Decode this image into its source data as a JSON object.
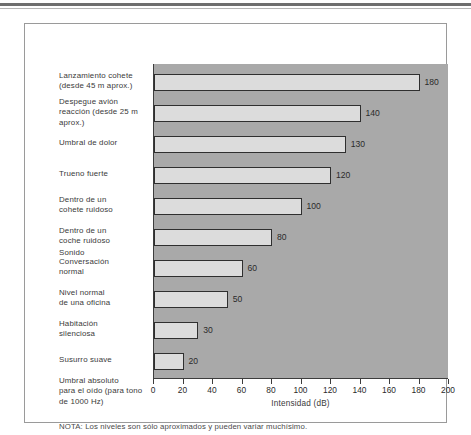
{
  "figure": {
    "note": "NOTA: Los niveles son sólo aproximados y pueden variar muchísimo.",
    "sound_marker": "Sonido"
  },
  "chart_data": {
    "type": "bar",
    "orientation": "horizontal",
    "title": "",
    "xlabel": "Intensidad (dB)",
    "ylabel": "",
    "xlim": [
      0,
      200
    ],
    "grid": false,
    "legend": null,
    "tick_labels": [
      "0",
      "20",
      "40",
      "60",
      "80",
      "100",
      "120",
      "140",
      "160",
      "180",
      "200"
    ],
    "ticks": [
      0,
      20,
      40,
      60,
      80,
      100,
      120,
      140,
      160,
      180,
      200
    ],
    "categories": [
      "Lanzamiento cohete (desde 45 m aprox.)",
      "Despegue avión reacción (desde 25 m aprox.)",
      "Umbral de dolor",
      "Trueno fuerte",
      "Dentro de un cohete ruidoso",
      "Dentro de un coche  ruidoso",
      "Conversación normal",
      "Nivel normal de una oficina",
      "Habitación silenciosa",
      "Susurro suave",
      "Umbral absoluto para el oído (para tono de 1000 Hz)"
    ],
    "category_lines": [
      [
        "Lanzamiento cohete",
        "(desde 45 m aprox.)"
      ],
      [
        "Despegue avión",
        "reacción (desde 25 m",
        "aprox.)"
      ],
      [
        "Umbral de dolor"
      ],
      [
        "Trueno fuerte"
      ],
      [
        "Dentro de un",
        "cohete ruidoso"
      ],
      [
        "Dentro de un",
        "coche  ruidoso"
      ],
      [
        "Conversación",
        "normal"
      ],
      [
        "Nivel normal",
        "de una oficina"
      ],
      [
        "Habitación",
        "silenciosa"
      ],
      [
        "Susurro suave"
      ],
      [
        "Umbral absoluto",
        "para el oído (para tono",
        "de 1000 Hz)"
      ]
    ],
    "values": [
      180,
      140,
      130,
      120,
      100,
      80,
      60,
      50,
      30,
      20,
      0
    ],
    "value_labels": [
      "180",
      "140",
      "130",
      "120",
      "100",
      "80",
      "60",
      "50",
      "30",
      "20",
      ""
    ],
    "colors": {
      "plot_background": "#a9a9a9",
      "bar_fill": "#dcdcdc",
      "bar_border": "#2f2f2f",
      "axis": "#3d3d3d",
      "text": "#2b2b2b",
      "page_background": "#ffffff"
    }
  }
}
